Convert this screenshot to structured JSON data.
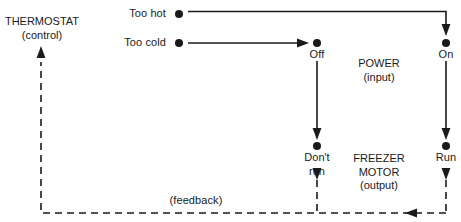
{
  "diagram": {
    "type": "feedback-control-flow-diagram",
    "title_visible": false,
    "colors": {
      "ink": "#1a1a1a",
      "background": "#ffffff"
    },
    "stages": {
      "control": {
        "name": "THERMOSTAT",
        "qualifier": "(control)"
      },
      "input": {
        "name": "POWER",
        "qualifier": "(input)"
      },
      "output": {
        "name": "FREEZER MOTOR",
        "name_line1": "FREEZER",
        "name_line2": "MOTOR",
        "qualifier": "(output)"
      }
    },
    "nodes": [
      {
        "id": "too-hot",
        "label": "Too hot",
        "x": 179,
        "y": 14,
        "label_side": "left"
      },
      {
        "id": "too-cold",
        "label": "Too cold",
        "x": 179,
        "y": 43,
        "label_side": "left"
      },
      {
        "id": "off",
        "label": "Off",
        "x": 317,
        "y": 43,
        "label_side": "below"
      },
      {
        "id": "on",
        "label": "On",
        "x": 446,
        "y": 43,
        "label_side": "below"
      },
      {
        "id": "dont-run",
        "label": "Don't run",
        "label_line1": "Don't",
        "label_line2": "run",
        "x": 317,
        "y": 146,
        "label_side": "below"
      },
      {
        "id": "run",
        "label": "Run",
        "x": 446,
        "y": 146,
        "label_side": "below"
      }
    ],
    "edges": [
      {
        "id": "too-hot-to-on",
        "from": "too-hot",
        "to": "on",
        "style": "solid",
        "routing": "right-then-down"
      },
      {
        "id": "too-cold-to-off",
        "from": "too-cold",
        "to": "off",
        "style": "solid",
        "routing": "right"
      },
      {
        "id": "off-to-dont-run",
        "from": "off",
        "to": "dont-run",
        "style": "solid",
        "routing": "down"
      },
      {
        "id": "on-to-run",
        "from": "on",
        "to": "run",
        "style": "solid",
        "routing": "down"
      },
      {
        "id": "dont-run-feedback",
        "from": "dont-run",
        "to": "feedback-bus",
        "style": "dashed",
        "routing": "down"
      },
      {
        "id": "run-feedback",
        "from": "run",
        "to": "feedback-bus",
        "style": "dashed",
        "routing": "down"
      },
      {
        "id": "feedback-bus",
        "from": "motor-outputs",
        "to": "thermostat",
        "style": "dashed",
        "routing": "left-then-up",
        "label": "(feedback)"
      }
    ],
    "feedback_label": "(feedback)"
  }
}
